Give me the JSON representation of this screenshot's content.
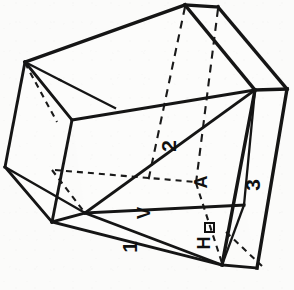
{
  "figure": {
    "background_color": "#fbfbfa",
    "line_color": "#151515",
    "canvas": {
      "width": 294,
      "height": 290
    },
    "projection": "oblique-isometric"
  },
  "labels": [
    {
      "id": "label-1",
      "text": "1",
      "name": "face-label-1",
      "x": 131,
      "y": 247,
      "rotation": -90,
      "font_size": 21,
      "meaning": "front-lower reference face"
    },
    {
      "id": "label-2",
      "text": "2",
      "name": "face-label-2",
      "x": 170,
      "y": 146,
      "rotation": -90,
      "font_size": 21,
      "meaning": "upper diagonal reference face"
    },
    {
      "id": "label-3",
      "text": "3",
      "name": "face-label-3",
      "x": 254,
      "y": 185,
      "rotation": -90,
      "font_size": 21,
      "meaning": "right narrow side face"
    },
    {
      "id": "label-A",
      "text": "A",
      "name": "section-label-a",
      "x": 202,
      "y": 182,
      "rotation": -90,
      "font_size": 20,
      "meaning": "section plane marker A"
    },
    {
      "id": "label-V",
      "text": "V",
      "name": "direction-label-v",
      "x": 145,
      "y": 213,
      "rotation": -90,
      "font_size": 20,
      "meaning": "vertical direction arrow marker"
    },
    {
      "id": "label-H",
      "text": "H",
      "name": "direction-label-h",
      "x": 205,
      "y": 243,
      "rotation": -90,
      "font_size": 20,
      "meaning": "horizontal direction arrow marker"
    }
  ],
  "geometry": {
    "vertices": {
      "top_apex": [
        185,
        5
      ],
      "top_right": [
        218,
        7
      ],
      "left_upper_back": [
        25,
        62
      ],
      "left_upper_front": [
        60,
        80
      ],
      "right_upper": [
        255,
        90
      ],
      "right_upper_outer": [
        287,
        89
      ],
      "left_lower_back": [
        5,
        167
      ],
      "left_mid_front": [
        72,
        120
      ],
      "left_lower_front": [
        52,
        222
      ],
      "center_junction": [
        85,
        213
      ],
      "hidden_center": [
        148,
        180
      ],
      "hidden_right": [
        196,
        182
      ],
      "bottom_apex": [
        222,
        265
      ],
      "bottom_right": [
        257,
        268
      ],
      "right_lower": [
        244,
        205
      ]
    },
    "solid_edge_count": 21,
    "hidden_edge_count": 7
  },
  "annotations": {
    "right_angle_marker": {
      "name": "right-angle-mark",
      "x": 209,
      "y": 226,
      "size": 8,
      "present": true
    }
  }
}
